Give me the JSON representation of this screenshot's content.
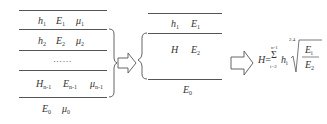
{
  "left_stack": {
    "layers": [
      {
        "thickness": "h",
        "thickness_sub": "1",
        "modulus": "E",
        "modulus_sub": "1",
        "poisson": "μ",
        "poisson_sub": "1"
      },
      {
        "thickness": "h",
        "thickness_sub": "2",
        "modulus": "E",
        "modulus_sub": "2",
        "poisson": "μ",
        "poisson_sub": "2"
      },
      {
        "ellipsis": "……"
      },
      {
        "thickness": "H",
        "thickness_sub": "n-1",
        "modulus": "E",
        "modulus_sub": "n-1",
        "poisson": "μ",
        "poisson_sub": "n-1"
      },
      {
        "modulus": "E",
        "modulus_sub": "0",
        "poisson": "μ",
        "poisson_sub": "0"
      }
    ]
  },
  "middle_stack": {
    "layers": [
      {
        "thickness": "h",
        "thickness_sub": "1",
        "modulus": "E",
        "modulus_sub": "1"
      },
      {
        "thickness": "H",
        "modulus": "E",
        "modulus_sub": "2"
      },
      {
        "modulus": "E",
        "modulus_sub": "0"
      }
    ]
  },
  "formula": {
    "lhs": "H",
    "equals": "=",
    "sum_symbol": "Σ",
    "sum_upper": "n-1",
    "sum_lower": "i=2",
    "term": "h",
    "term_sub": "i",
    "root_index": "2.4",
    "numerator": "E",
    "numerator_sub": "i",
    "denominator": "E",
    "denominator_sub": "2"
  }
}
